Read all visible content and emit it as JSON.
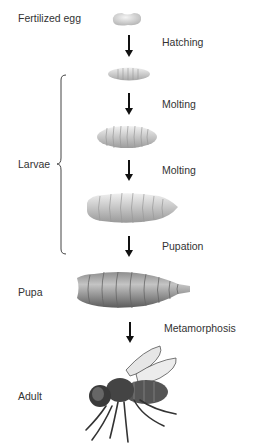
{
  "diagram": {
    "stages": [
      {
        "label": "Fertilized egg",
        "type": "egg"
      },
      {
        "label": "",
        "type": "larva-small"
      },
      {
        "label": "",
        "type": "larva-medium"
      },
      {
        "label": "",
        "type": "larva-large"
      },
      {
        "label": "Pupa",
        "type": "pupa"
      },
      {
        "label": "Adult",
        "type": "adult-fly"
      }
    ],
    "transitions": [
      "Hatching",
      "Molting",
      "Molting",
      "Pupation",
      "Metamorphosis"
    ],
    "group_label": "Larvae",
    "colors": {
      "arrow": "#111111",
      "text": "#333333",
      "larva": "#d8d8d8",
      "pupa": "#8a8a8a"
    }
  }
}
